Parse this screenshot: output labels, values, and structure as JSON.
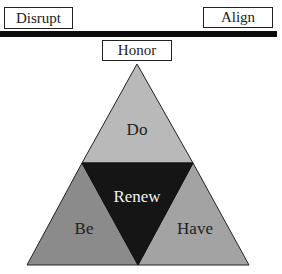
{
  "labels": {
    "disrupt": "Disrupt",
    "align": "Align",
    "honor": "Honor",
    "do": "Do",
    "renew": "Renew",
    "be": "Be",
    "have": "Have"
  },
  "colors": {
    "do": "#b9b9b9",
    "be": "#8b8b8b",
    "have": "#a3a3a3",
    "renew": "#151515",
    "beam": "#0c0c0c",
    "text_dark": "#222222",
    "text_light": "#f2f2f2"
  }
}
